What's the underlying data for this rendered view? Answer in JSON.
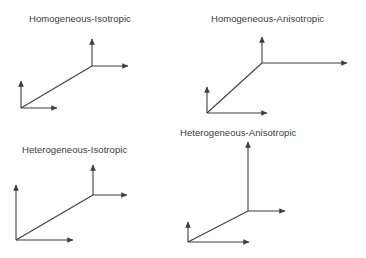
{
  "figure": {
    "width": 366,
    "height": 258,
    "background": "#ffffff",
    "stroke_color": "#3f3f3f",
    "text_color": "#3a3a3a"
  },
  "panels": [
    {
      "id": "homogeneous-isotropic",
      "label": "Homogeneous-Isotropic",
      "label_x": 29,
      "label_y": 14,
      "triads": [
        {
          "name": "small-triad",
          "origin_x": 21,
          "origin_y": 108,
          "up_x": 21,
          "up_y": 79,
          "right_x": 60,
          "right_y": 108,
          "depth_x": 92,
          "depth_y": 66
        },
        {
          "name": "large-triad",
          "origin_x": 92,
          "origin_y": 66,
          "up_x": 92,
          "up_y": 37,
          "right_x": 131,
          "right_y": 66,
          "depth_x": 21,
          "depth_y": 108
        }
      ]
    },
    {
      "id": "homogeneous-anisotropic",
      "label": "Homogeneous-Anisotropic",
      "label_x": 211,
      "label_y": 14,
      "triads": [
        {
          "name": "small-triad",
          "origin_x": 207,
          "origin_y": 113,
          "up_x": 207,
          "up_y": 85,
          "right_x": 270,
          "right_y": 113,
          "depth_x": 262,
          "depth_y": 63
        },
        {
          "name": "large-triad",
          "origin_x": 262,
          "origin_y": 63,
          "up_x": 262,
          "up_y": 35,
          "right_x": 350,
          "right_y": 63,
          "depth_x": 207,
          "depth_y": 113
        }
      ]
    },
    {
      "id": "heterogeneous-isotropic",
      "label": "Heterogeneous-Isotropic",
      "label_x": 22,
      "label_y": 145,
      "triads": [
        {
          "name": "large-triad",
          "origin_x": 16,
          "origin_y": 240,
          "up_x": 16,
          "up_y": 183,
          "right_x": 76,
          "right_y": 240,
          "depth_x": 93,
          "depth_y": 195
        },
        {
          "name": "small-triad",
          "origin_x": 93,
          "origin_y": 195,
          "up_x": 93,
          "up_y": 163,
          "right_x": 130,
          "right_y": 195,
          "depth_x": 16,
          "depth_y": 240
        }
      ]
    },
    {
      "id": "heterogeneous-anisotropic",
      "label": "Heterogeneous-Anisotropic",
      "label_x": 180,
      "label_y": 128,
      "triads": [
        {
          "name": "small-triad",
          "origin_x": 188,
          "origin_y": 242,
          "up_x": 188,
          "up_y": 220,
          "right_x": 252,
          "right_y": 242,
          "depth_x": 248,
          "depth_y": 211
        },
        {
          "name": "large-triad",
          "origin_x": 248,
          "origin_y": 211,
          "up_x": 248,
          "up_y": 140,
          "right_x": 288,
          "right_y": 211,
          "depth_x": 188,
          "depth_y": 242
        }
      ]
    }
  ]
}
